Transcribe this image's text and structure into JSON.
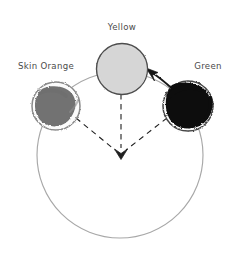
{
  "diagram": {
    "type": "color-wheel-mixing-diagram",
    "background_color": "#ffffff",
    "wheel": {
      "name": "color-wheel",
      "center_x": 120,
      "center_y": 155,
      "radius": 83,
      "stroke_color": "#a8a8a8"
    },
    "center_point": {
      "x": 120,
      "y": 155,
      "arrow_direction": "down"
    },
    "swatches": [
      {
        "id": "yellow",
        "label": "Yellow",
        "label_x": 122,
        "label_y": 30,
        "cx": 122,
        "cy": 69,
        "r": 25,
        "fill_color": "#d6d6d6",
        "stroke_color": "#555555",
        "fill_style": "solid-light"
      },
      {
        "id": "skin-orange",
        "label": "Skin Orange",
        "label_x": 46,
        "label_y": 69,
        "cx": 56,
        "cy": 106,
        "r": 24,
        "fill_color": "#6e6e6e",
        "stroke_color": "#7d7d7d",
        "fill_style": "scribble-mid"
      },
      {
        "id": "green",
        "label": "Green",
        "label_x": 208,
        "label_y": 69,
        "cx": 188,
        "cy": 106,
        "r": 25,
        "fill_color": "#0d0d0d",
        "stroke_color": "#3a3a3a",
        "fill_style": "scribble-dark"
      }
    ],
    "dashed_connectors": [
      {
        "id": "dash-skin-orange-to-center",
        "from": "skin-orange",
        "to": "center"
      },
      {
        "id": "dash-yellow-to-center",
        "from": "yellow",
        "to": "center"
      },
      {
        "id": "dash-green-to-center",
        "from": "green",
        "to": "center"
      }
    ],
    "solid_arrow": {
      "id": "arrow-green-to-yellow",
      "from": "green",
      "to": "yellow",
      "stroke_color": "#1a1a1a",
      "style": "curved-solid-arrow"
    }
  }
}
